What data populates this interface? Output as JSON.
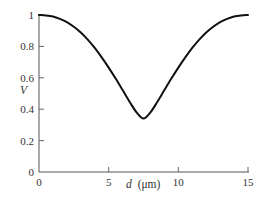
{
  "chart_data": {
    "type": "line",
    "title": "",
    "xlabel": "d (μm)",
    "xlabel_var": "d",
    "xlabel_unit": "(μm)",
    "ylabel": "V",
    "xlim": [
      0,
      15
    ],
    "ylim": [
      0,
      1
    ],
    "x_ticks": [
      0,
      5,
      10,
      15
    ],
    "x_tick_labels": [
      "0",
      "5",
      "10",
      "15"
    ],
    "y_ticks": [
      0,
      0.2,
      0.4,
      0.6,
      0.8,
      1
    ],
    "y_tick_labels": [
      "0",
      "0.2",
      "0.4",
      "0.6",
      "0.8",
      "1"
    ],
    "grid": false,
    "legend": null,
    "series": [
      {
        "name": "V",
        "color": "#111111",
        "x": [
          0,
          0.5,
          1,
          1.5,
          2,
          2.5,
          3,
          3.5,
          4,
          4.5,
          5,
          5.5,
          6,
          6.5,
          7,
          7.5,
          8,
          8.5,
          9,
          9.5,
          10,
          10.5,
          11,
          11.5,
          12,
          12.5,
          13,
          13.5,
          14,
          14.5,
          15
        ],
        "values": [
          1.0,
          0.997,
          0.99,
          0.975,
          0.955,
          0.925,
          0.888,
          0.843,
          0.79,
          0.73,
          0.665,
          0.595,
          0.522,
          0.448,
          0.38,
          0.34,
          0.38,
          0.448,
          0.522,
          0.595,
          0.665,
          0.73,
          0.79,
          0.843,
          0.888,
          0.925,
          0.955,
          0.975,
          0.99,
          0.997,
          1.0
        ]
      }
    ],
    "annotations": []
  }
}
